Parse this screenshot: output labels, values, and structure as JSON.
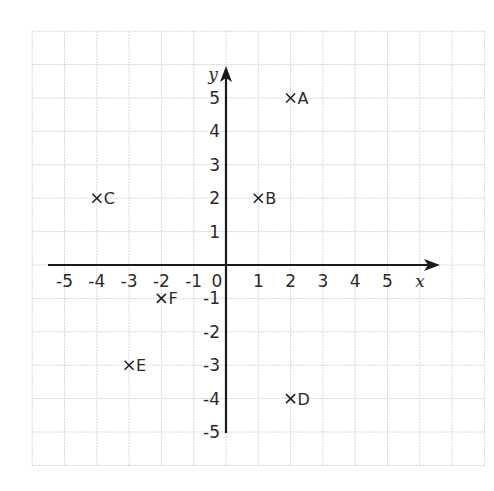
{
  "chart_data": {
    "type": "scatter",
    "title": "",
    "xlabel": "x",
    "ylabel": "y",
    "xlim": [
      -6,
      8
    ],
    "ylim": [
      -6,
      7
    ],
    "grid": true,
    "x_ticks": [
      -5,
      -4,
      -3,
      -2,
      -1,
      0,
      1,
      2,
      3,
      4,
      5
    ],
    "y_ticks": [
      5,
      4,
      3,
      2,
      1,
      -1,
      -2,
      -3,
      -4,
      -5
    ],
    "x_tick_labels": [
      "-5",
      "-4",
      "-3",
      "-2",
      "-1",
      "0",
      "1",
      "2",
      "3",
      "4",
      "5"
    ],
    "y_tick_labels": [
      "5",
      "4",
      "3",
      "2",
      "1",
      "-1",
      "-2",
      "-3",
      "-4",
      "-5"
    ],
    "marker": "x",
    "points": [
      {
        "label": "A",
        "x": 2,
        "y": 5
      },
      {
        "label": "B",
        "x": 1,
        "y": 2
      },
      {
        "label": "C",
        "x": -4,
        "y": 2
      },
      {
        "label": "D",
        "x": 2,
        "y": -4
      },
      {
        "label": "E",
        "x": -3,
        "y": -3
      },
      {
        "label": "F",
        "x": -2,
        "y": -1
      }
    ]
  },
  "layout": {
    "origin_px": [
      226,
      265
    ],
    "unit_x_px": 32.3,
    "unit_y_px": 33.4,
    "x_axis_px": [
      48,
      440
    ],
    "y_axis_px": [
      433,
      66
    ]
  },
  "colors": {
    "axis": "#1a1a1a",
    "grid": "#d6d6d6",
    "text": "#2a2a2a",
    "background": "#ffffff"
  }
}
